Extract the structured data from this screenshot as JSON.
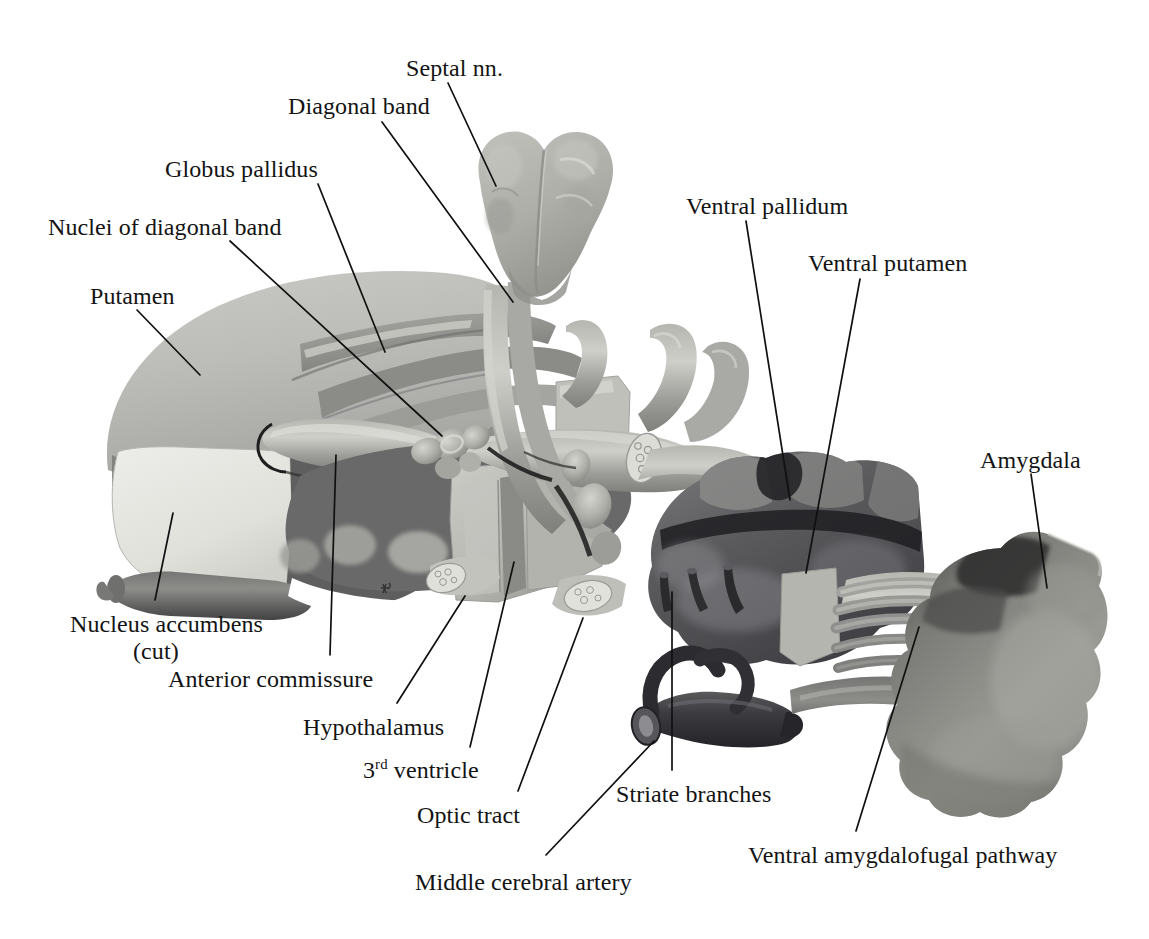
{
  "figure": {
    "background_color": "#ffffff",
    "label_color": "#131313",
    "leader_color": "#101010",
    "palette": {
      "putamen": "#b9b9b5",
      "putamen_light": "#c9c9c5",
      "accumbens_cut": "#e7e7e2",
      "globus_pallidus": "#9b9b97",
      "mid_gray": "#8c8c88",
      "dark_gray": "#6d6d6b",
      "darker_gray": "#55555a",
      "ventral_pallidum": "#5c5c60",
      "ventral_putamen": "#6a6a6e",
      "amygdala": "#8e8e8a",
      "septal": "#b3b3ae",
      "hypothalamus_block": "#bdbdb8",
      "vessel": "#9a9a96",
      "artery_dark": "#3d3d40",
      "highlight": "#d8d8d3"
    }
  },
  "labels": [
    {
      "id": "septal-nn",
      "text": "Septal nn.",
      "x": 406,
      "y": 55,
      "align": "left"
    },
    {
      "id": "diagonal-band",
      "text": "Diagonal band",
      "x": 288,
      "y": 93,
      "align": "left"
    },
    {
      "id": "globus-pallidus",
      "text": "Globus pallidus",
      "x": 165,
      "y": 156,
      "align": "left"
    },
    {
      "id": "nuclei-diagonal",
      "text": "Nuclei of diagonal band",
      "x": 48,
      "y": 214,
      "align": "left"
    },
    {
      "id": "putamen",
      "text": "Putamen",
      "x": 90,
      "y": 283,
      "align": "left"
    },
    {
      "id": "ventral-pallidum",
      "text": "Ventral pallidum",
      "x": 686,
      "y": 193,
      "align": "left"
    },
    {
      "id": "ventral-putamen",
      "text": "Ventral putamen",
      "x": 808,
      "y": 250,
      "align": "left"
    },
    {
      "id": "amygdala",
      "text": "Amygdala",
      "x": 980,
      "y": 447,
      "align": "left"
    },
    {
      "id": "nucleus-accumbens",
      "text": "Nucleus accumbens",
      "x": 70,
      "y": 611,
      "align": "left"
    },
    {
      "id": "nucleus-accumbens-cut",
      "text": "(cut)",
      "x": 133,
      "y": 638,
      "align": "left"
    },
    {
      "id": "anterior-commissure",
      "text": "Anterior commissure",
      "x": 168,
      "y": 666,
      "align": "left"
    },
    {
      "id": "hypothalamus",
      "text": "Hypothalamus",
      "x": 303,
      "y": 714,
      "align": "left"
    },
    {
      "id": "optic-tract",
      "text": "Optic tract",
      "x": 417,
      "y": 802,
      "align": "left"
    },
    {
      "id": "middle-cerebral",
      "text": "Middle cerebral artery",
      "x": 415,
      "y": 869,
      "align": "left"
    },
    {
      "id": "striate-branches",
      "text": "Striate branches",
      "x": 616,
      "y": 781,
      "align": "left"
    },
    {
      "id": "ventral-amygdalofugal",
      "text": "Ventral amygdalofugal pathway",
      "x": 748,
      "y": 842,
      "align": "left"
    }
  ],
  "special_labels": {
    "third_ventricle": {
      "id": "third-ventricle",
      "number": "3",
      "ordinal": "rd",
      "word": " ventricle",
      "x": 363,
      "y": 757
    }
  },
  "leader_lines": [
    {
      "for": "septal-nn",
      "x1": 448,
      "y1": 83,
      "x2": 496,
      "y2": 186
    },
    {
      "for": "diagonal-band",
      "x1": 382,
      "y1": 122,
      "x2": 513,
      "y2": 302
    },
    {
      "for": "globus-pallidus",
      "x1": 318,
      "y1": 184,
      "x2": 385,
      "y2": 352
    },
    {
      "for": "nuclei-diagonal",
      "x1": 230,
      "y1": 241,
      "x2": 442,
      "y2": 436
    },
    {
      "for": "putamen",
      "x1": 137,
      "y1": 310,
      "x2": 200,
      "y2": 375
    },
    {
      "for": "ventral-pallidum",
      "x1": 746,
      "y1": 221,
      "x2": 790,
      "y2": 500
    },
    {
      "for": "ventral-putamen",
      "x1": 860,
      "y1": 279,
      "x2": 806,
      "y2": 573
    },
    {
      "for": "amygdala",
      "x1": 1031,
      "y1": 474,
      "x2": 1047,
      "y2": 588
    },
    {
      "for": "nucleus-accumbens",
      "x1": 155,
      "y1": 600,
      "x2": 173,
      "y2": 513
    },
    {
      "for": "anterior-commissure",
      "x1": 330,
      "y1": 655,
      "x2": 336,
      "y2": 455
    },
    {
      "for": "hypothalamus",
      "x1": 397,
      "y1": 703,
      "x2": 465,
      "y2": 596
    },
    {
      "for": "third-ventricle",
      "x1": 470,
      "y1": 747,
      "x2": 514,
      "y2": 562
    },
    {
      "for": "optic-tract",
      "x1": 518,
      "y1": 791,
      "x2": 583,
      "y2": 618
    },
    {
      "for": "middle-cerebral",
      "x1": 546,
      "y1": 855,
      "x2": 654,
      "y2": 741
    },
    {
      "for": "striate-branches",
      "x1": 672,
      "y1": 770,
      "x2": 672,
      "y2": 592
    },
    {
      "for": "ventral-amygdalofugal",
      "x1": 856,
      "y1": 831,
      "x2": 919,
      "y2": 627
    }
  ],
  "artist_signature": {
    "present": true,
    "x": 386,
    "y": 588
  }
}
